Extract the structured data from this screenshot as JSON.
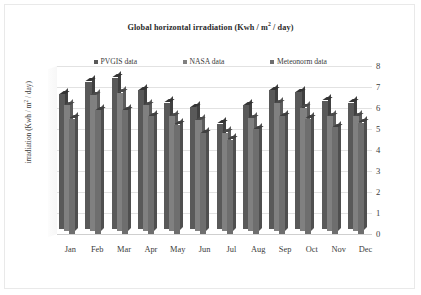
{
  "chart_data": {
    "type": "bar",
    "xlabel": "",
    "ylabel": "irradiation (Kwh / m² / day)",
    "ylim": [
      0,
      8
    ],
    "yticks": [
      0,
      1,
      2,
      3,
      4,
      5,
      6,
      7,
      8
    ],
    "grid": true,
    "legend_position": "top",
    "three_d": true,
    "categories": [
      "Jan",
      "Feb",
      "Mar",
      "Apr",
      "May",
      "Jun",
      "Jul",
      "Aug",
      "Sep",
      "Oct",
      "Nov",
      "Dec"
    ],
    "series": [
      {
        "name": "PVGIS data",
        "color": "#595959",
        "values": [
          6.4,
          7.0,
          7.2,
          6.6,
          6.0,
          5.8,
          5.0,
          5.9,
          6.6,
          6.5,
          6.1,
          6.0
        ]
      },
      {
        "name": "NASA data",
        "color": "#808080",
        "values": [
          6.0,
          6.5,
          6.6,
          6.0,
          5.5,
          5.3,
          4.7,
          5.4,
          6.1,
          5.9,
          5.5,
          5.5
        ]
      },
      {
        "name": "Meteonorm data",
        "color": "#6e6e6e",
        "values": [
          5.5,
          5.9,
          5.9,
          5.6,
          5.2,
          4.8,
          4.5,
          5.0,
          5.6,
          5.5,
          5.1,
          5.3
        ]
      }
    ]
  },
  "legend": {
    "items": [
      {
        "label": "PVGIS data",
        "color": "#595959"
      },
      {
        "label": "NASA data",
        "color": "#808080"
      },
      {
        "label": "Meteonorm data",
        "color": "#6e6e6e"
      }
    ]
  },
  "axis": {
    "y_title_main": "irradiation (Kwh / m",
    "y_title_sup": "2",
    "y_title_tail": " / day)"
  },
  "title": {
    "main": "Global horizontal irradiation (Kwh / m",
    "sup": "2",
    "tail": " / day)"
  }
}
